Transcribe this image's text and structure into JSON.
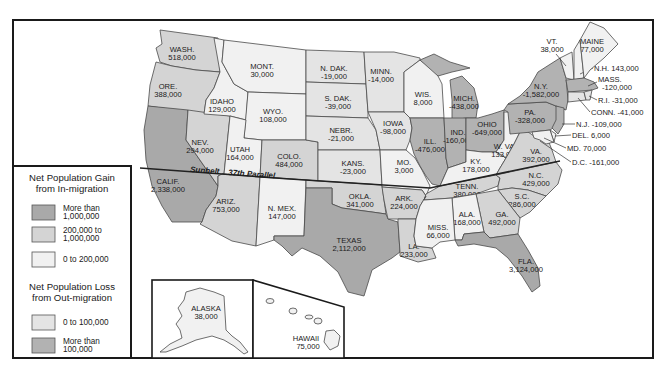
{
  "map": {
    "title": "Net Population Migration by State",
    "parallel_label": {
      "sunbelt": "Sunbelt",
      "parallel": "37th Parallel"
    }
  },
  "legend": {
    "gain_title_1": "Net Population Gain",
    "gain_title_2": "from In-migration",
    "gain_items": [
      {
        "line1": "More than",
        "line2": "1,000,000",
        "color": "#a9a9a9"
      },
      {
        "line1": "200,000 to",
        "line2": "1,000,000",
        "color": "#d4d4d4"
      },
      {
        "line1": "0 to 200,000",
        "line2": "",
        "color": "#f1f1f1"
      }
    ],
    "loss_title_1": "Net Population Loss",
    "loss_title_2": "from Out-migration",
    "loss_items": [
      {
        "line1": "0 to 100,000",
        "line2": "",
        "color": "#e4e4e4"
      },
      {
        "line1": "More than",
        "line2": "100,000",
        "color": "#b2b2b2"
      }
    ]
  },
  "states": {
    "wa": {
      "name": "WASH.",
      "value": "518,000",
      "category": "gain_200k_1m"
    },
    "or": {
      "name": "ORE.",
      "value": "388,000",
      "category": "gain_200k_1m"
    },
    "ca": {
      "name": "CALIF.",
      "value": "2,338,000",
      "category": "gain_over_1m"
    },
    "nv": {
      "name": "NEV.",
      "value": "294,000",
      "category": "gain_200k_1m"
    },
    "id": {
      "name": "IDAHO",
      "value": "129,000",
      "category": "gain_0_200k"
    },
    "mt": {
      "name": "MONT.",
      "value": "30,000",
      "category": "gain_0_200k"
    },
    "wy": {
      "name": "WYO.",
      "value": "108,000",
      "category": "gain_0_200k"
    },
    "ut": {
      "name": "UTAH",
      "value": "164,000",
      "category": "gain_0_200k"
    },
    "co": {
      "name": "COLO.",
      "value": "484,000",
      "category": "gain_200k_1m"
    },
    "az": {
      "name": "ARIZ.",
      "value": "753,000",
      "category": "gain_200k_1m"
    },
    "nm": {
      "name": "N. MEX.",
      "value": "147,000",
      "category": "gain_0_200k"
    },
    "nd": {
      "name": "N. DAK.",
      "value": "-19,000",
      "category": "loss_0_100k"
    },
    "sd": {
      "name": "S. DAK.",
      "value": "-39,000",
      "category": "loss_0_100k"
    },
    "ne": {
      "name": "NEBR.",
      "value": "-21,000",
      "category": "loss_0_100k"
    },
    "ks": {
      "name": "KANS.",
      "value": "-23,000",
      "category": "loss_0_100k"
    },
    "ok": {
      "name": "OKLA.",
      "value": "341,000",
      "category": "gain_200k_1m"
    },
    "tx": {
      "name": "TEXAS",
      "value": "2,112,000",
      "category": "gain_over_1m"
    },
    "mn": {
      "name": "MINN.",
      "value": "-14,000",
      "category": "loss_0_100k"
    },
    "ia": {
      "name": "IOWA",
      "value": "-98,000",
      "category": "loss_0_100k"
    },
    "mo": {
      "name": "MO.",
      "value": "3,000",
      "category": "gain_0_200k"
    },
    "ar": {
      "name": "ARK.",
      "value": "224,000",
      "category": "gain_200k_1m"
    },
    "la": {
      "name": "LA.",
      "value": "233,000",
      "category": "gain_200k_1m"
    },
    "wi": {
      "name": "WIS.",
      "value": "8,000",
      "category": "gain_0_200k"
    },
    "mi": {
      "name": "MICH.",
      "value": "-438,000",
      "category": "loss_over_100k"
    },
    "il": {
      "name": "ILL.",
      "value": "-476,000",
      "category": "loss_over_100k"
    },
    "in": {
      "name": "IND.",
      "value": "-160,000",
      "category": "loss_over_100k"
    },
    "oh": {
      "name": "OHIO",
      "value": "-649,000",
      "category": "loss_over_100k"
    },
    "ky": {
      "name": "KY.",
      "value": "178,000",
      "category": "gain_0_200k"
    },
    "tn": {
      "name": "TENN.",
      "value": "380,000",
      "category": "gain_200k_1m"
    },
    "ms": {
      "name": "MISS.",
      "value": "66,000",
      "category": "gain_0_200k"
    },
    "al": {
      "name": "ALA.",
      "value": "168,000",
      "category": "gain_0_200k"
    },
    "ga": {
      "name": "GA.",
      "value": "492,000",
      "category": "gain_200k_1m"
    },
    "fl": {
      "name": "FLA.",
      "value": "3,124,000",
      "category": "gain_over_1m"
    },
    "sc": {
      "name": "S.C.",
      "value": "286,000",
      "category": "gain_200k_1m"
    },
    "nc": {
      "name": "N.C.",
      "value": "429,000",
      "category": "gain_200k_1m"
    },
    "va": {
      "name": "VA.",
      "value": "392,000",
      "category": "gain_200k_1m"
    },
    "wv": {
      "name": "W. VA.",
      "value": "133,000",
      "category": "gain_0_200k"
    },
    "pa": {
      "name": "PA.",
      "value": "-328,000",
      "category": "loss_over_100k"
    },
    "ny": {
      "name": "N.Y.",
      "value": "-1,582,000",
      "category": "loss_over_100k"
    },
    "vt": {
      "name": "VT.",
      "value": "38,000",
      "category": "gain_0_200k"
    },
    "nh": {
      "name": "N.H.",
      "value": "143,000",
      "category": "gain_0_200k"
    },
    "me": {
      "name": "MAINE",
      "value": "77,000",
      "category": "gain_0_200k"
    },
    "ma": {
      "name": "MASS.",
      "value": "-120,000",
      "category": "loss_over_100k"
    },
    "ri": {
      "name": "R.I.",
      "value": "-31,000",
      "category": "loss_0_100k"
    },
    "ct": {
      "name": "CONN.",
      "value": "-41,000",
      "category": "loss_0_100k"
    },
    "nj": {
      "name": "N.J.",
      "value": "-109,000",
      "category": "loss_over_100k"
    },
    "de": {
      "name": "DEL.",
      "value": "6,000",
      "category": "gain_0_200k"
    },
    "md": {
      "name": "MD.",
      "value": "70,000",
      "category": "gain_0_200k"
    },
    "dc": {
      "name": "D.C.",
      "value": "-161,000",
      "category": "loss_over_100k"
    },
    "ak": {
      "name": "ALASKA",
      "value": "38,000",
      "category": "gain_0_200k"
    },
    "hi": {
      "name": "HAWAII",
      "value": "75,000",
      "category": "gain_0_200k"
    }
  }
}
